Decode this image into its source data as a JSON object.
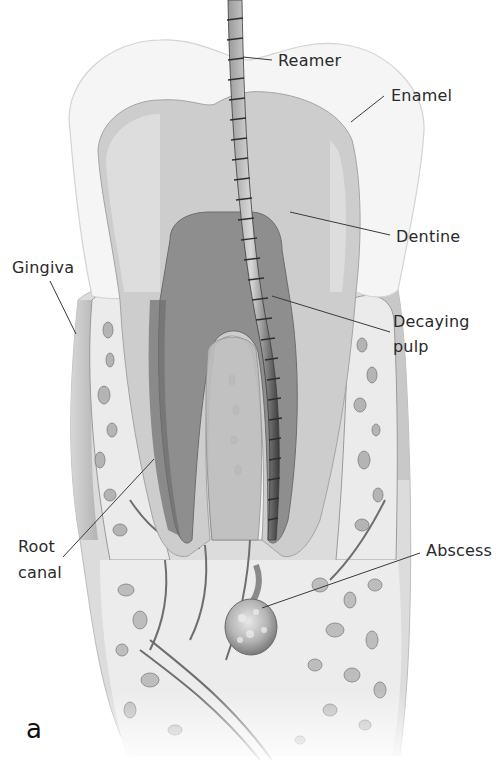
{
  "figure": {
    "panel_letter": "a",
    "labels": [
      {
        "id": "reamer",
        "text": "Reamer",
        "x": 278,
        "y": 51
      },
      {
        "id": "enamel",
        "text": "Enamel",
        "x": 391,
        "y": 86
      },
      {
        "id": "dentine",
        "text": "Dentine",
        "x": 396,
        "y": 227
      },
      {
        "id": "decaying-pulp-line1",
        "text": "Decaying",
        "x": 393,
        "y": 312
      },
      {
        "id": "decaying-pulp-line2",
        "text": "pulp",
        "x": 393,
        "y": 337
      },
      {
        "id": "gingiva",
        "text": "Gingiva",
        "x": 12,
        "y": 258
      },
      {
        "id": "root-canal-line1",
        "text": "Root",
        "x": 18,
        "y": 537
      },
      {
        "id": "root-canal-line2",
        "text": "canal",
        "x": 18,
        "y": 563
      },
      {
        "id": "abscess",
        "text": "Abscess",
        "x": 426,
        "y": 541
      }
    ],
    "colors": {
      "background": "#ffffff",
      "enamel": "#f4f4f4",
      "dentine": "#c8c8c8",
      "pulp": "#8f8f8f",
      "gum": "#b9b9b9",
      "bone": "#e6e6e6",
      "reamer": "#5a5a5a",
      "leader_line": "#3a3a3a",
      "text": "#2a2a2a"
    }
  }
}
